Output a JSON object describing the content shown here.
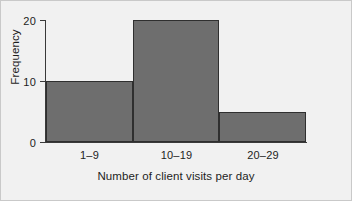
{
  "chart_data": {
    "type": "bar",
    "title": "",
    "xlabel": "Number of client visits per day",
    "ylabel": "Frequency",
    "categories": [
      "1–9",
      "10–19",
      "20–29"
    ],
    "values": [
      10,
      20,
      5
    ],
    "ylim": [
      0,
      20
    ],
    "yticks": [
      0,
      10,
      20
    ],
    "ytick_labels": [
      "0",
      "10",
      "20"
    ],
    "grid": false,
    "legend": false,
    "bar_color": "#6e6e6e",
    "bar_edge_color": "#2f2f2f",
    "background_color": "#f1f1f1",
    "axis_color": "#3a3a3a"
  },
  "axes": {
    "y_title": "Frequency",
    "x_title": "Number of client visits per day",
    "y_tick_0": "0",
    "y_tick_1": "10",
    "y_tick_2": "20",
    "x_cat_0": "1–9",
    "x_cat_1": "10–19",
    "x_cat_2": "20–29"
  }
}
